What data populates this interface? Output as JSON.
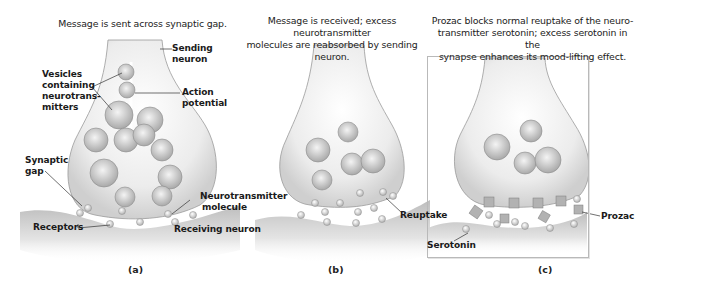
{
  "panels": [
    {
      "id": "a",
      "letter": "(a)",
      "caption": "Message is sent across synaptic gap.",
      "labels": {
        "sending_neuron": [
          "Sending",
          "neuron"
        ],
        "vesicles": [
          "Vesicles",
          "containing",
          "neurotrans-",
          "mitters"
        ],
        "action_potential": [
          "Action",
          "potential"
        ],
        "synaptic_gap": [
          "Synaptic",
          "gap"
        ],
        "neurotransmitter_molecule": [
          "Neurotransmitter",
          "molecule"
        ],
        "receptors": "Receptors",
        "receiving_neuron": "Receiving neuron"
      }
    },
    {
      "id": "b",
      "letter": "(b)",
      "caption": [
        "Message is received; excess neurotransmitter",
        "molecules are reabsorbed by sending neuron."
      ],
      "labels": {
        "reuptake": "Reuptake"
      }
    },
    {
      "id": "c",
      "letter": "(c)",
      "caption": [
        "Prozac blocks normal reuptake of the neuro-",
        "transmitter serotonin; excess serotonin in the",
        "synapse enhances its mood-lifting effect."
      ],
      "labels": {
        "prozac": "Prozac",
        "serotonin": "Serotonin"
      }
    }
  ],
  "colors": {
    "neuron_fill": "#e9e9e9",
    "neuron_edge": "#9a9a9a",
    "vesicle": "#c9c9c9",
    "molecule": "#d8d8d8",
    "prozac": "#b0b0b0",
    "text": "#1a1a1a"
  }
}
